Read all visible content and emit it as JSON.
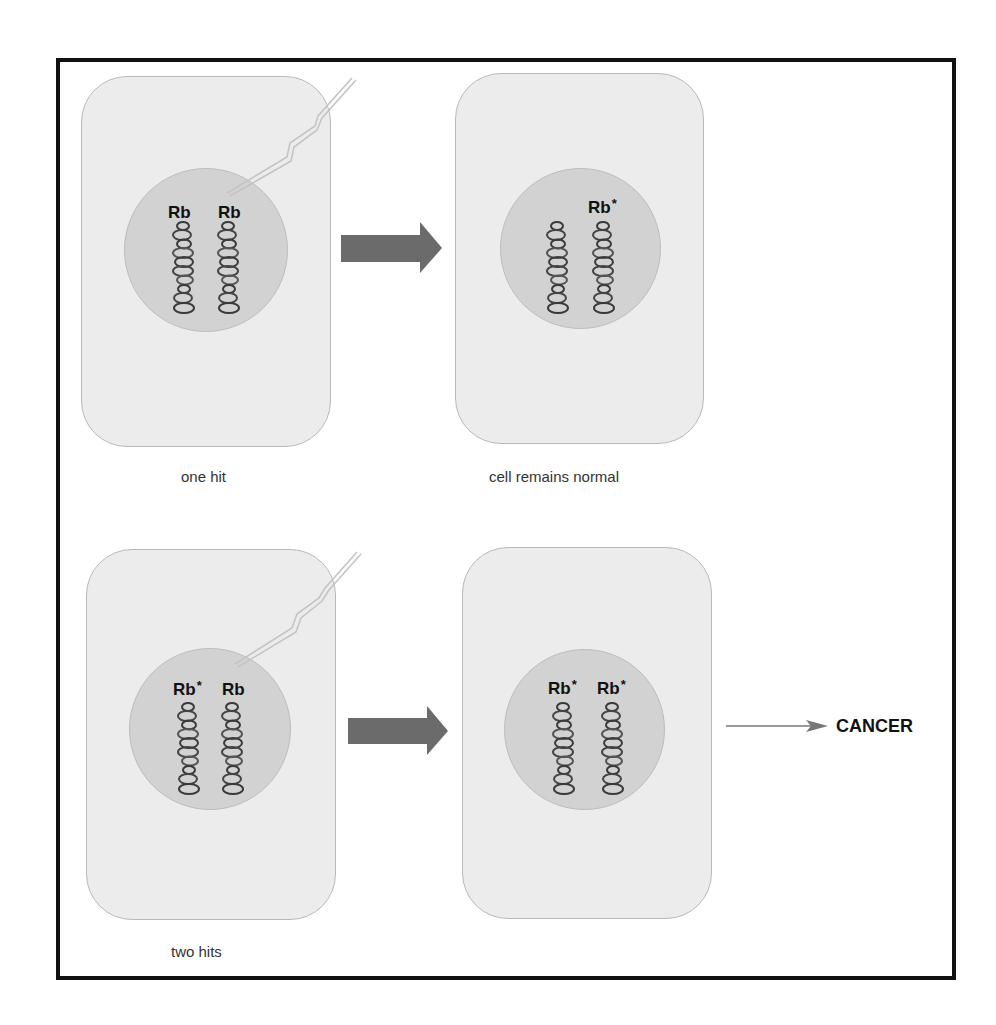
{
  "diagram": {
    "colors": {
      "frame": "#111111",
      "cell_fill": "#ececec",
      "cell_border": "#b9b9b9",
      "nucleus_fill": "#d2d2d2",
      "arrow_fill": "#6b6b6b",
      "chromosome_stroke": "#3a3a3a",
      "lightning": "#bdbdbd"
    },
    "rows": [
      {
        "caption_before": "one hit",
        "caption_after": "cell remains normal",
        "before": {
          "labels": [
            "Rb",
            "Rb"
          ],
          "mutated": [
            false,
            false
          ],
          "hit_icon": "lightning-bolt"
        },
        "after": {
          "labels": [
            "",
            "Rb"
          ],
          "mutated": [
            false,
            true
          ]
        }
      },
      {
        "caption_before": "two hits",
        "before": {
          "labels": [
            "Rb",
            "Rb"
          ],
          "mutated": [
            true,
            false
          ],
          "hit_icon": "lightning-bolt"
        },
        "after": {
          "labels": [
            "Rb",
            "Rb"
          ],
          "mutated": [
            true,
            true
          ]
        },
        "outcome": "CANCER"
      }
    ],
    "mutation_marker": "*"
  }
}
